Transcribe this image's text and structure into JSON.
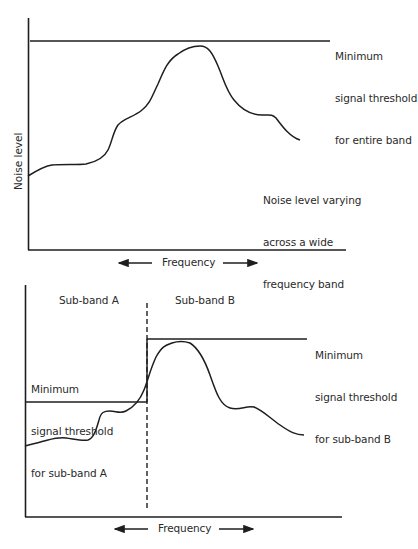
{
  "figures": {
    "top": {
      "y_axis_label": "Noise level",
      "x_axis_label": "Frequency",
      "threshold_label": [
        "Minimum",
        "signal threshold",
        "for entire band"
      ],
      "curve_label": [
        "Noise level varying",
        "across a wide",
        "frequency band"
      ]
    },
    "bottom": {
      "x_axis_label": "Frequency",
      "subband_a_label": "Sub-band A",
      "subband_b_label": "Sub-band B",
      "threshold_a_label": [
        "Minimum",
        "signal threshold",
        "for sub-band A"
      ],
      "threshold_b_label": [
        "Minimum",
        "signal threshold",
        "for sub-band B"
      ]
    }
  },
  "colors": {
    "line": "#1e1e1e",
    "text": "#2a2a2a",
    "background": "#ffffff"
  }
}
